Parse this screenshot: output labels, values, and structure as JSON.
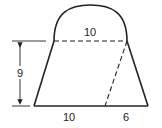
{
  "figure": {
    "type": "geometry-composite-shape",
    "labels": {
      "semicircle_diameter": "10",
      "height": "9",
      "bottom_left_segment": "10",
      "bottom_right_segment": "6"
    },
    "colors": {
      "stroke": "#222222",
      "background": "#ffffff"
    }
  }
}
